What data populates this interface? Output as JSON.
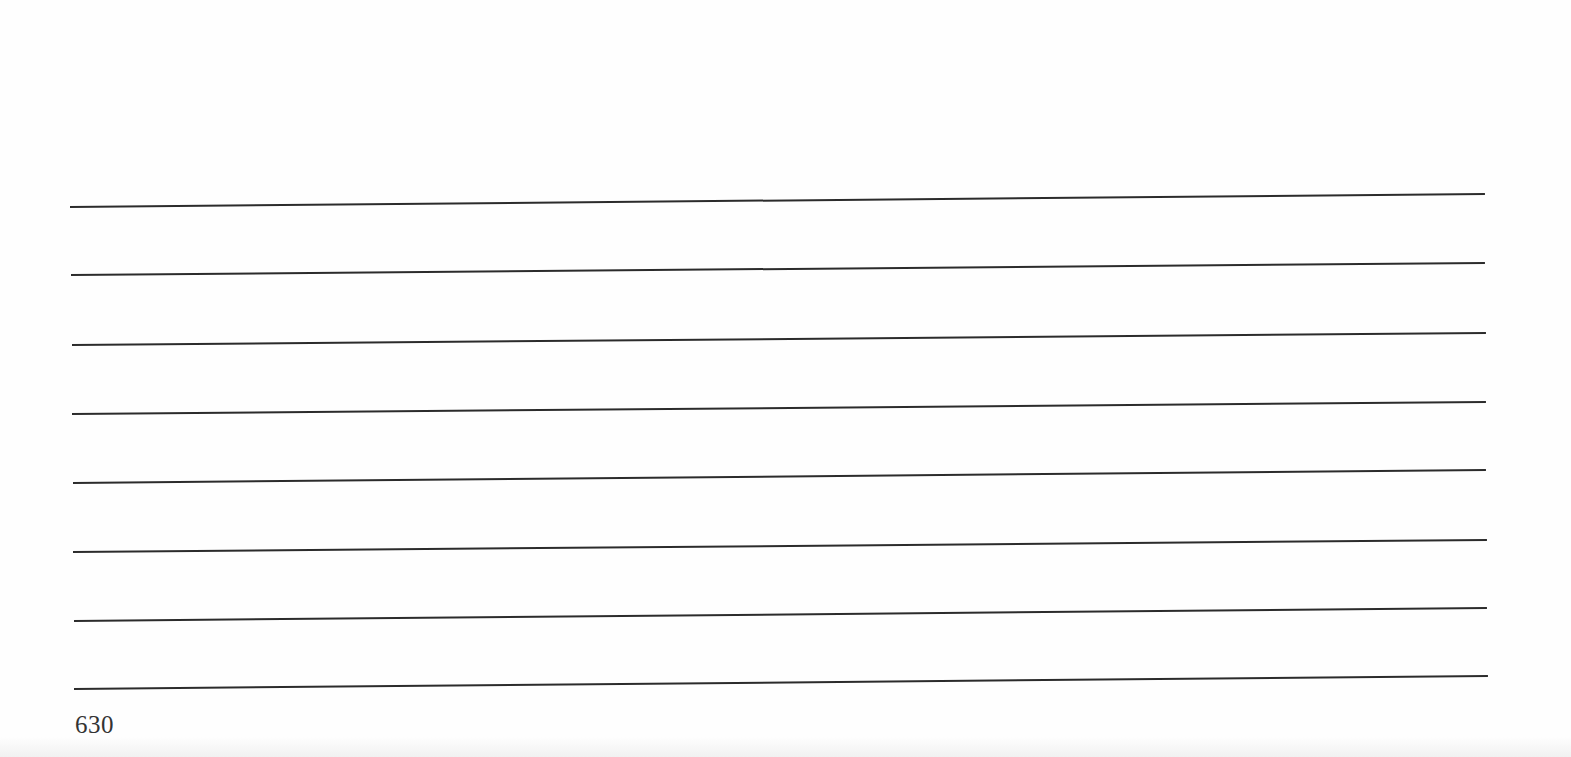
{
  "page": {
    "page_number": "630",
    "rules": [
      {
        "x1": 70,
        "y1": 207,
        "x2": 1485,
        "y2": 194
      },
      {
        "x1": 71,
        "y1": 275,
        "x2": 1485,
        "y2": 263
      },
      {
        "x1": 72,
        "y1": 345,
        "x2": 1486,
        "y2": 333
      },
      {
        "x1": 72,
        "y1": 414,
        "x2": 1486,
        "y2": 402
      },
      {
        "x1": 73,
        "y1": 483,
        "x2": 1486,
        "y2": 470
      },
      {
        "x1": 73,
        "y1": 552,
        "x2": 1487,
        "y2": 540
      },
      {
        "x1": 74,
        "y1": 621,
        "x2": 1487,
        "y2": 608
      },
      {
        "x1": 74,
        "y1": 689,
        "x2": 1488,
        "y2": 676
      }
    ],
    "colors": {
      "rule": "#2b2b2b",
      "paper": "#fefefe",
      "text": "#333333"
    }
  }
}
